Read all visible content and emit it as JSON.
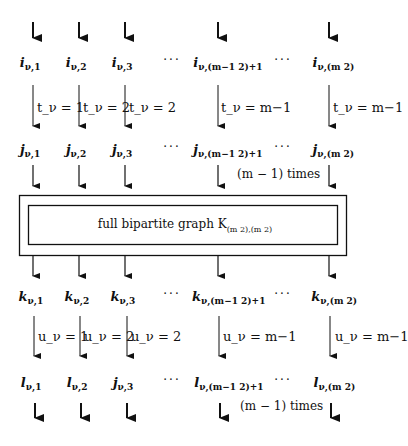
{
  "diagram": {
    "type": "flow-diagram",
    "columns_x": [
      33,
      79,
      125,
      218,
      329
    ],
    "dots_x": [
      172,
      283
    ],
    "rows": {
      "i": {
        "var": "i",
        "labels": [
          "i_{ν,1}",
          "i_{ν,2}",
          "i_{ν,3}",
          "i_{ν,(m-1 choose 2)+1}",
          "i_{ν,(m choose 2)}"
        ],
        "subscripts": [
          "ν,1",
          "ν,2",
          "ν,3",
          "ν,(m−1 2)+1",
          "ν,(m 2)"
        ]
      },
      "t_edges": {
        "labels": [
          "t_ν = 1",
          "t_ν = 2",
          "t_ν = 2",
          "t_ν = m−1",
          "t_ν = m−1"
        ]
      },
      "j": {
        "var": "j",
        "labels": [
          "j_{ν,1}",
          "j_{ν,2}",
          "j_{ν,3}",
          "j_{ν,(m-1 choose 2)+1}",
          "j_{ν,(m choose 2)}"
        ],
        "subscripts": [
          "ν,1",
          "ν,2",
          "ν,3",
          "ν,(m−1 2)+1",
          "ν,(m 2)"
        ]
      },
      "k": {
        "var": "k",
        "labels": [
          "k_{ν,1}",
          "k_{ν,2}",
          "k_{ν,3}",
          "k_{ν,(m-1 choose 2)+1}",
          "k_{ν,(m choose 2)}"
        ],
        "subscripts": [
          "ν,1",
          "ν,2",
          "ν,3",
          "ν,(m−1 2)+1",
          "ν,(m 2)"
        ]
      },
      "u_edges": {
        "labels": [
          "u_ν = 1",
          "u_ν = 2",
          "u_ν = 2",
          "u_ν = m−1",
          "u_ν = m−1"
        ]
      },
      "l": {
        "vars": [
          "l",
          "l",
          "j",
          "l",
          "l"
        ],
        "labels": [
          "l_{ν,1}",
          "l_{ν,2}",
          "j_{ν,3}",
          "l_{ν,(m-1 choose 2)+1}",
          "l_{ν,(m choose 2)}"
        ],
        "subscripts": [
          "ν,1",
          "ν,2",
          "ν,3",
          "ν,(m−1 2)+1",
          "ν,(m 2)"
        ]
      }
    },
    "ellipsis": "···",
    "times_label_upper": "(m − 1) times",
    "times_label_lower": "(m − 1) times",
    "box": {
      "text": "full bipartite graph K",
      "subscript": "(m 2),(m 2)"
    },
    "colors": {
      "stroke": "#111111",
      "background": "#ffffff"
    }
  }
}
